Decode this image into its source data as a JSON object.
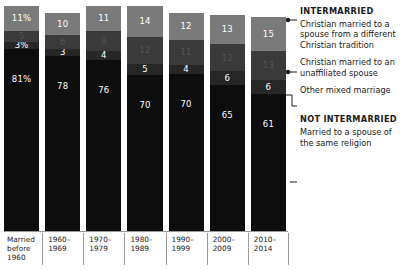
{
  "chart_data": {
    "type": "bar",
    "title": "",
    "subtitle": "",
    "xlabel": "",
    "ylabel": "",
    "ylim": [
      0,
      100
    ],
    "stacked": true,
    "stack_mode": "percent",
    "grid": false,
    "legend_position": "right",
    "categories": [
      "Married before 1960",
      "1960-1969",
      "1970-1979",
      "1980-1989",
      "1990-1999",
      "2000-2009",
      "2010-2014"
    ],
    "series": [
      {
        "name": "Christian married to a spouse from a different Christian tradition",
        "group": "INTERMARRIED",
        "color": "#7a7a7a",
        "values": [
          11,
          10,
          11,
          14,
          12,
          13,
          15
        ],
        "labels": [
          "11%",
          "10",
          "11",
          "14",
          "12",
          "13",
          "15"
        ]
      },
      {
        "name": "Christian married to an unaffiliated spouse",
        "group": "INTERMARRIED",
        "color": "#3a3a3a",
        "values": [
          5,
          6,
          9,
          12,
          11,
          12,
          13
        ],
        "labels": [
          "5",
          "6",
          "9",
          "12",
          "11",
          "12",
          "13"
        ]
      },
      {
        "name": "Other mixed marriage",
        "group": "INTERMARRIED",
        "color": "#262626",
        "values": [
          3,
          3,
          4,
          5,
          4,
          6,
          6
        ],
        "labels": [
          "3%",
          "3",
          "4",
          "5",
          "4",
          "6",
          "6"
        ]
      },
      {
        "name": "Married to a spouse of the same religion",
        "group": "NOT INTERMARRIED",
        "color": "#0d0d0d",
        "values": [
          81,
          78,
          76,
          70,
          70,
          65,
          61
        ],
        "labels": [
          "81%",
          "78",
          "76",
          "70",
          "70",
          "65",
          "61"
        ]
      }
    ]
  },
  "axis": {
    "categories": [
      {
        "line1": "Married",
        "line2": "before",
        "line3": "1960"
      },
      {
        "line1": "1960–",
        "line2": "1969",
        "line3": ""
      },
      {
        "line1": "1970–",
        "line2": "1979",
        "line3": ""
      },
      {
        "line1": "1980–",
        "line2": "1989",
        "line3": ""
      },
      {
        "line1": "1990–",
        "line2": "1999",
        "line3": ""
      },
      {
        "line1": "2000–",
        "line2": "2009",
        "line3": ""
      },
      {
        "line1": "2010–",
        "line2": "2014",
        "line3": ""
      }
    ]
  },
  "legend": {
    "heading_intermarried": "INTERMARRIED",
    "heading_not_intermarried": "NOT INTERMARRIED",
    "item_different_tradition": "Christian married to a spouse from a different Christian tradition",
    "item_unaffiliated": "Christian married to an unaffiliated spouse",
    "item_other_mixed": "Other mixed marriage",
    "item_same_religion": "Married to a spouse of the same religion"
  }
}
